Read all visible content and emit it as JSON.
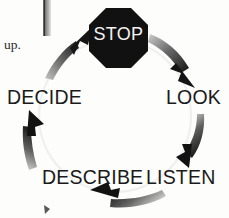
{
  "page": {
    "kind": "scanned-diagram",
    "width": 229,
    "height": 218,
    "background_color": "#fdfdfc"
  },
  "diagram": {
    "type": "cyclical-flow",
    "direction": "clockwise",
    "title_node": "STOP",
    "stop_sign": {
      "shape": "octagon",
      "label": "STOP",
      "fill_color": "#111111",
      "text_color": "#f2f2f0",
      "center_x": 118,
      "center_y": 38,
      "radius": 31
    },
    "nodes": [
      {
        "id": "stop",
        "label": "STOP",
        "position": "top",
        "x": 118,
        "y": 38
      },
      {
        "id": "look",
        "label": "LOOK",
        "position": "right",
        "x": 193,
        "y": 99
      },
      {
        "id": "listen",
        "label": "LISTEN",
        "position": "bottom-right",
        "x": 180,
        "y": 179
      },
      {
        "id": "describe",
        "label": "DESCRIBE",
        "position": "bottom-left",
        "x": 85,
        "y": 179
      },
      {
        "id": "decide",
        "label": "DECIDE",
        "position": "left",
        "x": 40,
        "y": 99
      }
    ],
    "arrows": [
      {
        "id": "decide-to-stop",
        "from": "DECIDE",
        "to": "STOP",
        "arrowhead": "up-right"
      },
      {
        "id": "stop-to-look",
        "from": "STOP",
        "to": "LOOK",
        "arrowhead": "down-right"
      },
      {
        "id": "look-to-listen",
        "from": "LOOK",
        "to": "LISTEN",
        "arrowhead": "down-left"
      },
      {
        "id": "listen-to-describe",
        "from": "LISTEN",
        "to": "DESCRIBE",
        "arrowhead": "up-left"
      },
      {
        "id": "describe-to-decide",
        "from": "DESCRIBE",
        "to": "DECIDE",
        "arrowhead": "up"
      }
    ],
    "arrow_color_dark": "#1c1c1c",
    "arrow_color_light": "#b9b9b9",
    "guide_circle_color": "#ececec"
  },
  "scan_artifacts": {
    "margin_note": "up.",
    "gutter_bar_color": "#8d8d8d",
    "gutter_bar_edge_color": "#3a3a3a",
    "speck_color": "#555555"
  }
}
